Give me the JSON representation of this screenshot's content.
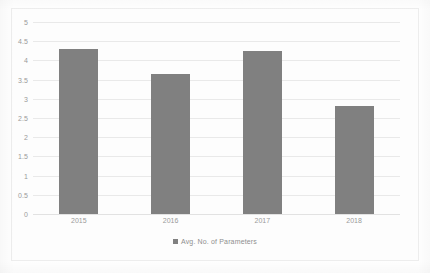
{
  "chart_data": {
    "type": "bar",
    "title": "",
    "xlabel": "",
    "ylabel": "",
    "categories": [
      "2015",
      "2016",
      "2017",
      "2018"
    ],
    "series": [
      {
        "name": "Avg. No. of Parameters",
        "values": [
          4.3,
          3.65,
          4.25,
          2.8
        ]
      }
    ],
    "ylim": [
      0,
      5
    ],
    "ytick_step": 0.5,
    "yticks": [
      "0",
      "0.5",
      "1",
      "1.5",
      "2",
      "2.5",
      "3",
      "3.5",
      "4",
      "4.5",
      "5"
    ],
    "ytick_values": [
      0,
      0.5,
      1,
      1.5,
      2,
      2.5,
      3,
      3.5,
      4,
      4.5,
      5
    ],
    "grid": true,
    "legend_position": "bottom-center",
    "bar_color": "#808080",
    "gridline_color": "#e9e9e9",
    "tick_label_color": "#9a9a9a"
  },
  "legend": {
    "marker_name": "legend-color-swatch",
    "label": "Avg. No. of Parameters"
  }
}
